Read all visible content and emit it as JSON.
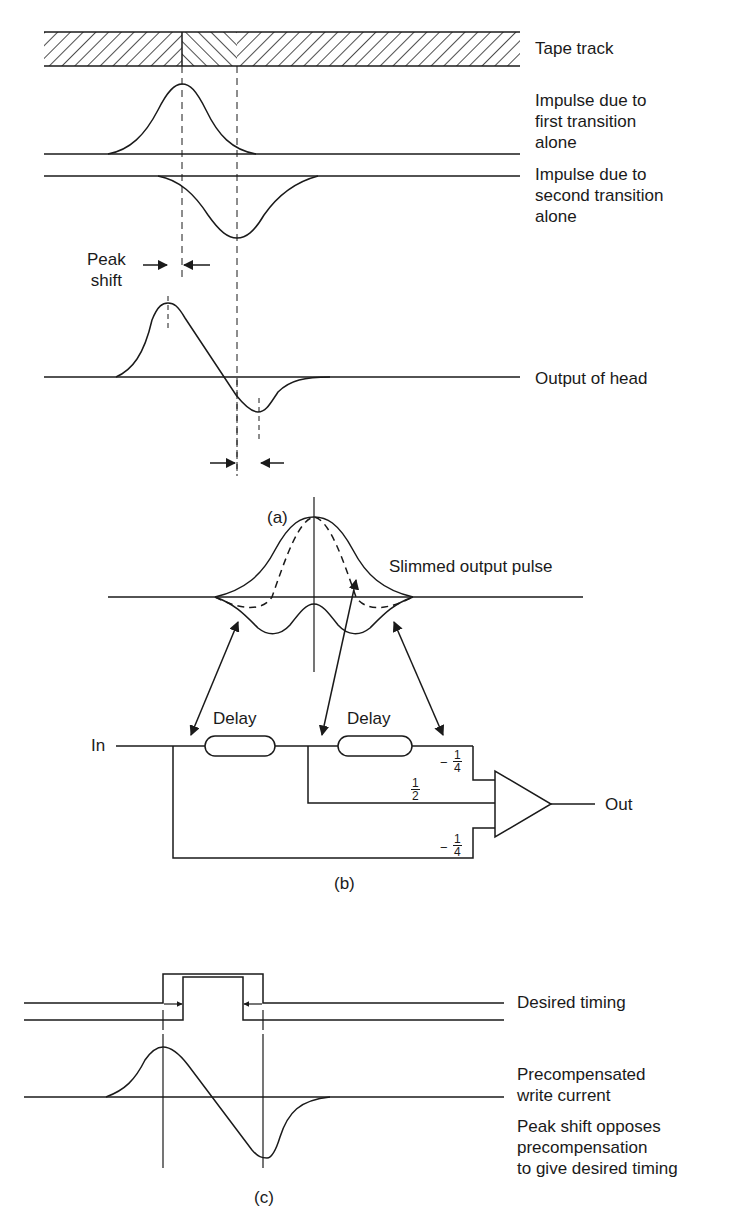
{
  "panel_a": {
    "caption": "(a)",
    "labels": {
      "tape_track": "Tape track",
      "impulse_first": "Impulse due to\nfirst transition\nalone",
      "impulse_second": "Impulse due to\nsecond transition\nalone",
      "peak_shift": "Peak\nshift",
      "output_of_head": "Output of head"
    }
  },
  "panel_b": {
    "caption": "(b)",
    "labels": {
      "slimmed_output_pulse": "Slimmed output pulse",
      "in": "In",
      "out": "Out",
      "delay_1": "Delay",
      "delay_2": "Delay"
    },
    "coefficients": {
      "top": {
        "sign": "−",
        "num": "1",
        "den": "4"
      },
      "middle": {
        "sign": "",
        "num": "1",
        "den": "2"
      },
      "bottom": {
        "sign": "−",
        "num": "1",
        "den": "4"
      }
    }
  },
  "panel_c": {
    "caption": "(c)",
    "labels": {
      "desired_timing": "Desired timing",
      "precompensated": "Precompensated\nwrite current",
      "peak_shift_opposes": "Peak shift opposes\nprecompensation\nto give desired timing"
    }
  }
}
